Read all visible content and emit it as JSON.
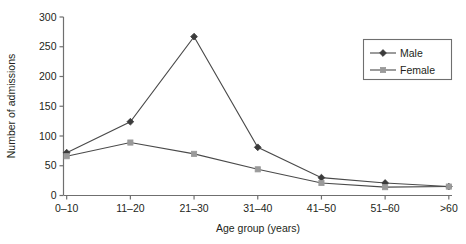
{
  "chart_data": {
    "type": "line",
    "title": "",
    "xlabel": "Age group (years)",
    "ylabel": "Number of admissions",
    "categories": [
      "0–10",
      "11–20",
      "21–30",
      "31–40",
      "41–50",
      "51–60",
      ">60"
    ],
    "ylim": [
      0,
      300
    ],
    "yticks": [
      0,
      50,
      100,
      150,
      200,
      250,
      300
    ],
    "ytick_labels": [
      "0",
      "50",
      "100",
      "150",
      "200",
      "250",
      "300"
    ],
    "grid": false,
    "legend_position": "top-right",
    "series": [
      {
        "name": "Male",
        "values": [
          72,
          124,
          267,
          81,
          30,
          21,
          15
        ],
        "color": "#3b3b3b",
        "marker": "diamond"
      },
      {
        "name": "Female",
        "values": [
          66,
          89,
          70,
          44,
          21,
          14,
          15
        ],
        "color": "#9a9a9a",
        "marker": "square"
      }
    ]
  },
  "legend": {
    "items": [
      {
        "label": "Male"
      },
      {
        "label": "Female"
      }
    ],
    "border_color": "#6f6f6f"
  },
  "axes": {
    "line_color": "#6f6f6f"
  }
}
